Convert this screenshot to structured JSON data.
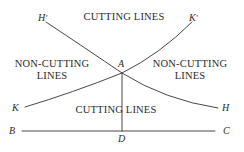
{
  "figure": {
    "background_color": "#ffffff",
    "stroke_color": "#333333",
    "text_color": "#2b2b2b",
    "width": 244,
    "height": 152
  },
  "region_labels": {
    "cutting_top": "CUTTING LINES",
    "non_cutting_left": "NON-CUTTING\nLINES",
    "non_cutting_right": "NON-CUTTING\nLINES",
    "cutting_bottom": "CUTTING LINES"
  },
  "point_labels": {
    "h_prime": "H",
    "h_prime_mark": "'",
    "k_prime": "K",
    "k_prime_mark": "'",
    "a": "A",
    "k": "K",
    "h": "H",
    "b": "B",
    "c": "C",
    "d": "D"
  },
  "geometry": {
    "intersection_point_a": [
      122,
      73
    ],
    "foot_point_d": [
      122,
      131
    ],
    "baseline_b": [
      22,
      131
    ],
    "baseline_c": [
      215,
      131
    ],
    "curve_h_prime_to_h": {
      "start": [
        46,
        22
      ],
      "end": [
        218,
        108
      ],
      "through": [
        122,
        73
      ]
    },
    "curve_k_to_k_prime": {
      "start": [
        25,
        107
      ],
      "end": [
        192,
        22
      ],
      "through": [
        122,
        73
      ]
    }
  }
}
